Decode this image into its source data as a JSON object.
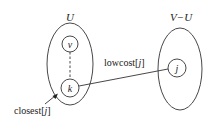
{
  "diagram": {
    "sets": [
      {
        "id": "U",
        "label": "U"
      },
      {
        "id": "VminusU",
        "label": "V−U"
      }
    ],
    "nodes": [
      {
        "id": "v",
        "label": "v",
        "set": "U"
      },
      {
        "id": "k",
        "label": "k",
        "set": "U"
      },
      {
        "id": "j",
        "label": "j",
        "set": "V−U"
      }
    ],
    "edges": [
      {
        "from": "v",
        "to": "k",
        "style": "dashed"
      },
      {
        "from": "k",
        "to": "j",
        "style": "solid",
        "label": "lowcost[j]"
      }
    ],
    "annotations": {
      "lowcost_prefix": "lowcost[",
      "lowcost_index": "j",
      "lowcost_suffix": "]",
      "closest_prefix": "closest[",
      "closest_index": "j",
      "closest_suffix": "]"
    },
    "colors": {
      "stroke": "#333333",
      "text": "#222222",
      "background": "#ffffff"
    }
  }
}
